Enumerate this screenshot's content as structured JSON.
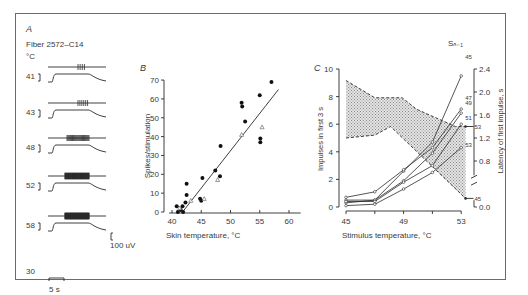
{
  "figure": {
    "panel_a": {
      "letter": "A",
      "fiber_label": "Fiber 2572–C14",
      "unit_label": "°C",
      "traces": [
        {
          "temp": "41",
          "spike_count": 4
        },
        {
          "temp": "43",
          "spike_count": 6
        },
        {
          "temp": "48",
          "spike_count": 25
        },
        {
          "temp": "52",
          "spike_count": 40
        },
        {
          "temp": "58",
          "spike_count": 60
        }
      ],
      "baseline_label": "30",
      "amplitude_scale": "100 uV",
      "time_scale": "5 s"
    },
    "panel_b": {
      "letter": "B",
      "xlabel": "Skin temperature, °C",
      "ylabel": "Spikes/stimulation"
    },
    "panel_c": {
      "letter": "C",
      "xlabel": "Stimulus temperature, °C",
      "ylabel_left": "Impulses in first 3 s",
      "ylabel_right": "Latency of first impulse, s",
      "series_header": "Sₙ₋₁",
      "right_axis_ticks": [
        "0.0",
        "0.8",
        "1.2",
        "1.6",
        "2.0",
        "2.4"
      ]
    }
  },
  "chart_data": [
    {
      "panel": "B",
      "type": "scatter",
      "title": "",
      "xlabel": "Skin temperature, °C",
      "ylabel": "Spikes/stimulation",
      "xlim": [
        40,
        62
      ],
      "ylim": [
        0,
        70
      ],
      "xticks": [
        40,
        45,
        50,
        55,
        60
      ],
      "yticks": [
        0,
        10,
        20,
        30,
        40,
        50,
        60,
        70
      ],
      "grid": false,
      "series": [
        {
          "name": "filled circles",
          "marker": "circle-filled",
          "points": [
            [
              40.8,
              3
            ],
            [
              41.0,
              0
            ],
            [
              41.5,
              1
            ],
            [
              41.8,
              3
            ],
            [
              41.9,
              0
            ],
            [
              42.3,
              5
            ],
            [
              42.5,
              9
            ],
            [
              42.5,
              15
            ],
            [
              44.8,
              7
            ],
            [
              45.0,
              6
            ],
            [
              45.2,
              18
            ],
            [
              47.4,
              22
            ],
            [
              48.2,
              19
            ],
            [
              48.3,
              35
            ],
            [
              51.9,
              58
            ],
            [
              52.0,
              56
            ],
            [
              52.5,
              48
            ],
            [
              55.0,
              62
            ],
            [
              55.1,
              39
            ],
            [
              55.1,
              37
            ],
            [
              57.0,
              69
            ]
          ]
        },
        {
          "name": "open triangles",
          "marker": "triangle-open",
          "points": [
            [
              41.3,
              2
            ],
            [
              43.2,
              6
            ],
            [
              45.5,
              7
            ],
            [
              47.8,
              17
            ],
            [
              51.9,
              41
            ],
            [
              55.4,
              45
            ]
          ]
        }
      ],
      "fit_line": {
        "x": [
          41.8,
          58.2
        ],
        "y": [
          0,
          65
        ]
      }
    },
    {
      "panel": "C",
      "type": "line",
      "title": "",
      "xlabel": "Stimulus temperature, °C",
      "ylabel_left": "Impulses in first 3 s",
      "ylabel_right": "Latency of first impulse, s",
      "x": [
        45,
        47,
        49,
        51,
        53
      ],
      "xticks": [
        45,
        47,
        49,
        51,
        53
      ],
      "xtick_labels": [
        "45",
        "",
        "49",
        "",
        "53"
      ],
      "ylim_left": [
        0,
        10
      ],
      "yticks_left": [
        0,
        2,
        4,
        6,
        8,
        10
      ],
      "ylim_right": [
        0.0,
        2.4
      ],
      "yticks_right": [
        0.0,
        0.8,
        1.2,
        1.6,
        2.0,
        2.4
      ],
      "series": [
        {
          "name": "S(n-1)=45",
          "values": [
            0.3,
            0.5,
            2.6,
            4.7,
            9.5
          ]
        },
        {
          "name": "S(n-1)=47",
          "values": [
            0.7,
            1.1,
            2.7,
            4.3,
            7.1
          ]
        },
        {
          "name": "S(n-1)=49",
          "values": [
            0.5,
            0.5,
            1.9,
            3.9,
            6.8
          ]
        },
        {
          "name": "S(n-1)=51",
          "values": [
            0.4,
            0.4,
            1.8,
            3.0,
            6.0
          ]
        },
        {
          "name": "S(n-1)=53",
          "values": [
            0.1,
            0.2,
            1.3,
            2.5,
            4.3
          ]
        }
      ],
      "latency_band": {
        "upper_dashed": {
          "x": [
            45,
            47,
            48.9,
            49.9,
            52.6,
            53.3
          ],
          "y_s": [
            2.2,
            1.9,
            1.9,
            1.7,
            1.4,
            1.4
          ]
        },
        "lower_dashed": {
          "x": [
            45,
            47,
            48.1,
            53.3
          ],
          "y_s": [
            1.2,
            1.25,
            1.4,
            0.15
          ]
        },
        "end_labels": [
          "53",
          "45"
        ]
      }
    }
  ]
}
